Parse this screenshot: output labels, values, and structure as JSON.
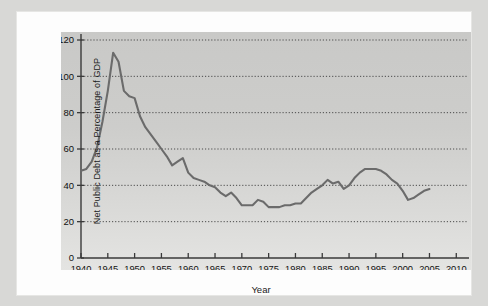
{
  "figure": {
    "background_color": "#d8d8d6",
    "page_color": "#fdfdfd",
    "panel_color": "#cdcdcb",
    "line_color": "#6b6b6b",
    "axis_color": "#3a3a3a",
    "grid_color": "#4a4a4a"
  },
  "chart_data": {
    "type": "line",
    "title": "",
    "xlabel": "Year",
    "ylabel": "Net Public Debt as a Percentage of GDP",
    "xlim": [
      1940,
      2012
    ],
    "ylim": [
      0,
      120
    ],
    "xticks": [
      1940,
      1945,
      1950,
      1955,
      1960,
      1965,
      1970,
      1975,
      1980,
      1985,
      1990,
      1995,
      2000,
      2005,
      2010
    ],
    "xtick_labels": [
      "1940",
      "1945",
      "1950",
      "1955",
      "1960",
      "1965",
      "1970",
      "1975",
      "1980",
      "1985",
      "1990",
      "1995",
      "2000",
      "2005",
      "2010"
    ],
    "yticks": [
      0,
      20,
      40,
      60,
      80,
      100,
      120
    ],
    "ytick_labels": [
      "0",
      "20",
      "40",
      "60",
      "80",
      "100",
      "120"
    ],
    "grid": true,
    "grid_axis": "y",
    "grid_style": "dotted",
    "legend": false,
    "series": [
      {
        "name": "Net Public Debt as a Percentage of GDP",
        "x": [
          1940,
          1941,
          1942,
          1943,
          1944,
          1945,
          1946,
          1947,
          1948,
          1949,
          1950,
          1951,
          1952,
          1953,
          1954,
          1955,
          1956,
          1957,
          1958,
          1959,
          1960,
          1961,
          1962,
          1963,
          1964,
          1965,
          1966,
          1967,
          1968,
          1969,
          1970,
          1971,
          1972,
          1973,
          1974,
          1975,
          1976,
          1977,
          1978,
          1979,
          1980,
          1981,
          1982,
          1983,
          1984,
          1985,
          1986,
          1987,
          1988,
          1989,
          1990,
          1991,
          1992,
          1993,
          1994,
          1995,
          1996,
          1997,
          1998,
          1999,
          2000,
          2001,
          2002,
          2003,
          2004,
          2005
        ],
        "y": [
          48,
          49,
          53,
          61,
          75,
          92,
          113,
          108,
          92,
          89,
          88,
          78,
          72,
          68,
          64,
          60,
          56,
          51,
          53,
          55,
          47,
          44,
          43,
          42,
          40,
          39,
          36,
          34,
          36,
          33,
          29,
          29,
          29,
          32,
          31,
          28,
          28,
          28,
          29,
          29,
          30,
          30,
          33,
          36,
          38,
          40,
          43,
          41,
          42,
          38,
          40,
          44,
          47,
          49,
          49,
          49,
          48,
          46,
          43,
          41,
          37,
          32,
          33,
          35,
          37,
          38
        ]
      }
    ]
  }
}
